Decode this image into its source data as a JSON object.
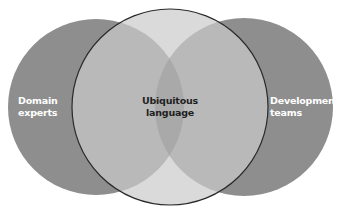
{
  "diagram": {
    "type": "venn",
    "sets": [
      {
        "id": "domain-experts",
        "label_line1": "Domain",
        "label_line2": "experts",
        "fill": "#8e8e8e"
      },
      {
        "id": "ubiquitous-language",
        "label_line1": "Ubiquitous",
        "label_line2": "language",
        "fill": "#dadada",
        "stroke": "#2a2a2a"
      },
      {
        "id": "development-teams",
        "label_line1": "Development",
        "label_line2": "teams",
        "fill": "#8e8e8e"
      }
    ],
    "colors": {
      "outer_only": "#8e8e8e",
      "outer_center_overlap": "#b9b9b9",
      "center_only": "#dadada",
      "triple_overlap": "#a8a8a8",
      "center_outline": "#2a2a2a",
      "background": "#ffffff"
    }
  }
}
